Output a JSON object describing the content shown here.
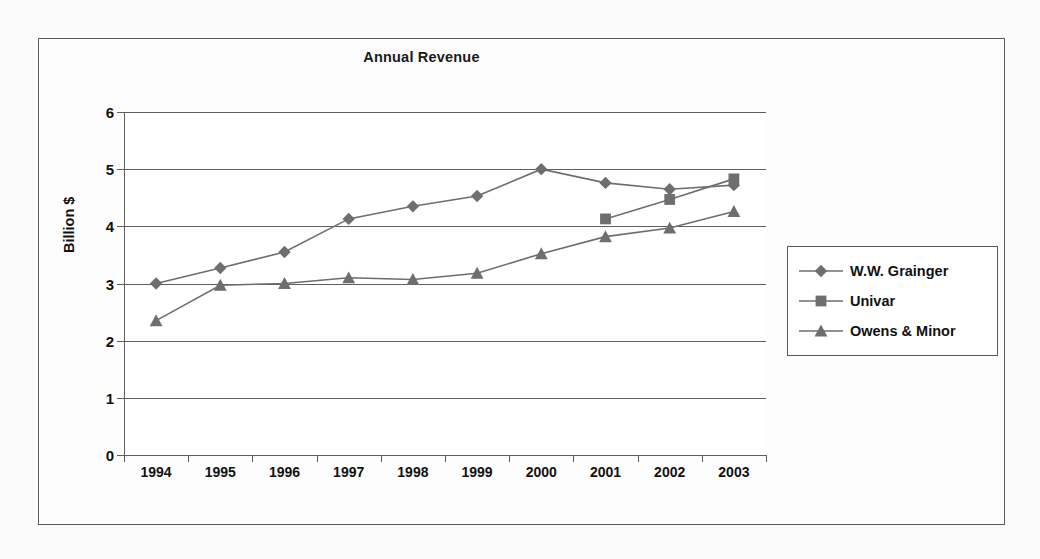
{
  "figure": {
    "title": "Annual Revenue"
  },
  "chart_data": {
    "type": "line",
    "title": "Annual Revenue",
    "xlabel": "",
    "ylabel": "Billion $",
    "categories": [
      "1994",
      "1995",
      "1996",
      "1997",
      "1998",
      "1999",
      "2000",
      "2001",
      "2002",
      "2003"
    ],
    "ylim": [
      0,
      6
    ],
    "yticks": [
      "0",
      "1",
      "2",
      "3",
      "4",
      "5",
      "6"
    ],
    "grid": "horizontal",
    "legend_position": "right",
    "series": [
      {
        "name": "W.W. Grainger",
        "marker": "diamond",
        "color": "#6e6e6e",
        "values": [
          3.0,
          3.27,
          3.55,
          4.13,
          4.35,
          4.53,
          5.0,
          4.76,
          4.65,
          4.72
        ]
      },
      {
        "name": "Univar",
        "marker": "square",
        "color": "#6e6e6e",
        "values": [
          null,
          null,
          null,
          null,
          null,
          null,
          null,
          4.13,
          4.47,
          4.83
        ]
      },
      {
        "name": "Owens & Minor",
        "marker": "triangle",
        "color": "#6e6e6e",
        "values": [
          2.35,
          2.97,
          3.0,
          3.1,
          3.07,
          3.18,
          3.52,
          3.82,
          3.97,
          4.26
        ]
      }
    ]
  }
}
